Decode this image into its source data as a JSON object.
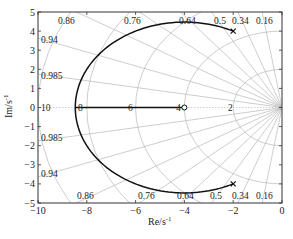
{
  "chart_data": {
    "type": "line",
    "title": "",
    "subtitle": "Root locus with damping-ratio / natural-frequency grid",
    "xlabel": "Re/s",
    "xlabel_sup": "-1",
    "ylabel": "Im/s",
    "ylabel_sup": "-1",
    "xlim": [
      -10,
      0
    ],
    "ylim": [
      -5,
      5
    ],
    "xticks": [
      -10,
      -8,
      -6,
      -4,
      -2,
      0
    ],
    "yticks": [
      -5,
      -4,
      -3,
      -2,
      -1,
      0,
      1,
      2,
      3,
      4,
      5
    ],
    "xtick_labels": [
      "−10",
      "−8",
      "−6",
      "−4",
      "−2",
      "0"
    ],
    "ytick_labels": [
      "−5",
      "−4",
      "−3",
      "−2",
      "−1",
      "0",
      "1",
      "2",
      "3",
      "4",
      "5"
    ],
    "grid": true,
    "legend": null,
    "poles": [
      {
        "re": -2,
        "im": 4,
        "marker": "x"
      },
      {
        "re": -2,
        "im": -4,
        "marker": "x"
      }
    ],
    "zeros": [
      {
        "re": -4,
        "im": 0,
        "marker": "o"
      }
    ],
    "series": [
      {
        "name": "root-locus-circle",
        "description": "Circular locus branch centered at (-4, 0), radius sqrt(20) ≈ 4.47, from poles -2±4j to breakaway at -8.47",
        "center": [
          -4,
          0
        ],
        "radius": 4.472,
        "breakaway": -8.47
      },
      {
        "name": "root-locus-real-axis",
        "x": [
          -8.47,
          -4
        ],
        "y": [
          0,
          0
        ]
      }
    ],
    "damping_ratio_lines": [
      "0.16",
      "0.34",
      "0.5",
      "0.64",
      "0.76",
      "0.86",
      "0.94",
      "0.985"
    ],
    "natural_frequency_circles": [
      "2",
      "4",
      "6",
      "8",
      "10"
    ],
    "annotations": {
      "damping_top": [
        {
          "text": "0.86",
          "x": 58,
          "y": 24
        },
        {
          "text": "0.76",
          "x": 124,
          "y": 24
        },
        {
          "text": "0.64",
          "x": 179,
          "y": 24
        },
        {
          "text": "0.5",
          "x": 214,
          "y": 24
        },
        {
          "text": "0.34",
          "x": 232,
          "y": 24
        },
        {
          "text": "0.16",
          "x": 256,
          "y": 24
        }
      ],
      "damping_left_top": [
        {
          "text": "0.94",
          "x": 41,
          "y": 43
        },
        {
          "text": "0.985",
          "x": 41,
          "y": 79
        }
      ],
      "damping_left_bottom": [
        {
          "text": "0.985",
          "x": 41,
          "y": 141
        },
        {
          "text": "0.94",
          "x": 41,
          "y": 177
        }
      ],
      "damping_bottom": [
        {
          "text": "0.86",
          "x": 77,
          "y": 199
        },
        {
          "text": "0.76",
          "x": 138,
          "y": 199
        },
        {
          "text": "0.64",
          "x": 177,
          "y": 199
        },
        {
          "text": "0.5",
          "x": 210,
          "y": 199
        },
        {
          "text": "0.34",
          "x": 232,
          "y": 199
        },
        {
          "text": "0.16",
          "x": 256,
          "y": 199
        }
      ],
      "wn_labels": [
        {
          "text": "10",
          "x": 41,
          "y": 111
        },
        {
          "text": "8",
          "x": 78,
          "y": 111
        },
        {
          "text": "6",
          "x": 128,
          "y": 111
        },
        {
          "text": "4",
          "x": 176,
          "y": 111
        },
        {
          "text": "2",
          "x": 228,
          "y": 111
        }
      ]
    }
  },
  "colors": {
    "locus": "#111111",
    "grid": "#b8b8b8",
    "axis": "#333333",
    "text": "#222222"
  }
}
